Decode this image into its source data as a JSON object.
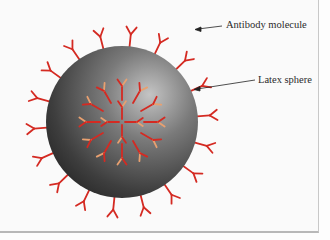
{
  "figure": {
    "labels": {
      "antibody": "Antibody molecule",
      "sphere": "Latex sphere"
    },
    "colors": {
      "antibody_outer": "#d42a22",
      "antibody_light": "#e8a070",
      "sphere_dark": "#2a2a2a",
      "sphere_light": "#b8b8b8",
      "background": "#fafafa"
    },
    "sphere": {
      "cx": 122,
      "cy": 122,
      "r": 76
    }
  }
}
